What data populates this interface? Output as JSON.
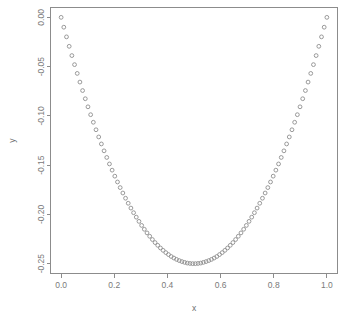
{
  "chart_data": {
    "type": "scatter",
    "title": "",
    "xlabel": "x",
    "ylabel": "y",
    "xlim": [
      -0.04,
      1.04
    ],
    "ylim": [
      -0.26,
      0.01
    ],
    "grid": false,
    "legend": null,
    "marker": "open-circle",
    "marker_color": "#8f8f8f",
    "point_count": 100,
    "formula": "y = x * (x - 1)",
    "xticks": [
      0.0,
      0.2,
      0.4,
      0.6,
      0.8,
      1.0
    ],
    "xticklabels": [
      "0.0",
      "0.2",
      "0.4",
      "0.6",
      "0.8",
      "1.0"
    ],
    "yticks": [
      0.0,
      -0.05,
      -0.1,
      -0.15,
      -0.2,
      -0.25
    ],
    "yticklabels": [
      "0.00",
      "-0.05",
      "-0.10",
      "-0.15",
      "-0.20",
      "-0.25"
    ],
    "x": [
      0.0,
      0.0101,
      0.0202,
      0.0303,
      0.0404,
      0.0505,
      0.0606,
      0.0707,
      0.0808,
      0.0909,
      0.101,
      0.1111,
      0.1212,
      0.1313,
      0.1414,
      0.1515,
      0.1616,
      0.1717,
      0.1818,
      0.1919,
      0.202,
      0.2121,
      0.2222,
      0.2323,
      0.2424,
      0.2525,
      0.2626,
      0.2727,
      0.2828,
      0.2929,
      0.303,
      0.3131,
      0.3232,
      0.3333,
      0.3434,
      0.3535,
      0.3636,
      0.3737,
      0.3838,
      0.3939,
      0.404,
      0.4141,
      0.4242,
      0.4343,
      0.4444,
      0.4545,
      0.4646,
      0.4747,
      0.4848,
      0.4949,
      0.5051,
      0.5152,
      0.5253,
      0.5354,
      0.5455,
      0.5556,
      0.5657,
      0.5758,
      0.5859,
      0.596,
      0.6061,
      0.6162,
      0.6263,
      0.6364,
      0.6465,
      0.6566,
      0.6667,
      0.6768,
      0.6869,
      0.697,
      0.7071,
      0.7172,
      0.7273,
      0.7374,
      0.7475,
      0.7576,
      0.7677,
      0.7778,
      0.7879,
      0.798,
      0.8081,
      0.8182,
      0.8283,
      0.8384,
      0.8485,
      0.8586,
      0.8687,
      0.8788,
      0.8889,
      0.899,
      0.9091,
      0.9192,
      0.9293,
      0.9394,
      0.9495,
      0.9596,
      0.9697,
      0.9798,
      0.9899,
      1.0
    ],
    "y": [
      0.0,
      -0.01,
      -0.0198,
      -0.0294,
      -0.0388,
      -0.048,
      -0.0569,
      -0.0657,
      -0.0743,
      -0.0826,
      -0.0908,
      -0.0988,
      -0.1065,
      -0.1141,
      -0.1214,
      -0.1285,
      -0.1355,
      -0.1422,
      -0.1488,
      -0.1551,
      -0.1612,
      -0.1671,
      -0.1728,
      -0.1783,
      -0.1836,
      -0.1887,
      -0.1936,
      -0.1983,
      -0.2028,
      -0.2071,
      -0.2112,
      -0.2151,
      -0.2188,
      -0.2222,
      -0.2255,
      -0.2286,
      -0.2314,
      -0.2341,
      -0.2365,
      -0.2388,
      -0.2408,
      -0.2427,
      -0.2443,
      -0.2457,
      -0.2469,
      -0.2479,
      -0.2487,
      -0.2494,
      -0.2498,
      -0.25,
      -0.25,
      -0.2498,
      -0.2494,
      -0.2487,
      -0.2479,
      -0.2469,
      -0.2457,
      -0.2443,
      -0.2427,
      -0.2408,
      -0.2388,
      -0.2365,
      -0.2341,
      -0.2314,
      -0.2286,
      -0.2255,
      -0.2222,
      -0.2188,
      -0.2151,
      -0.2112,
      -0.2071,
      -0.2028,
      -0.1983,
      -0.1936,
      -0.1887,
      -0.1836,
      -0.1783,
      -0.1728,
      -0.1671,
      -0.1612,
      -0.1551,
      -0.1488,
      -0.1422,
      -0.1355,
      -0.1285,
      -0.1214,
      -0.1141,
      -0.1065,
      -0.0988,
      -0.0908,
      -0.0826,
      -0.0743,
      -0.0657,
      -0.0569,
      -0.048,
      -0.0388,
      -0.0294,
      -0.0198,
      -0.01,
      0.0
    ]
  }
}
